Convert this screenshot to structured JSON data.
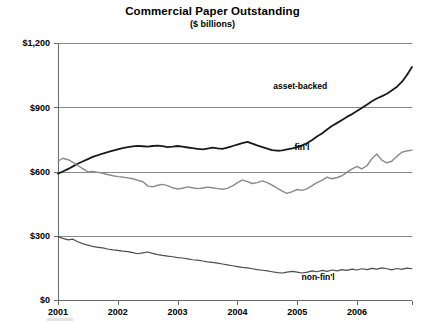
{
  "chart_data": {
    "type": "line",
    "title": "Commercial Paper Outstanding",
    "subtitle": "($ billions)",
    "xlabel": "",
    "ylabel": "",
    "ylim": [
      0,
      1200
    ],
    "xlim": [
      2001.0,
      2006.92
    ],
    "yticks": [
      0,
      300,
      600,
      900,
      1200
    ],
    "ytick_labels": [
      "$0",
      "$300",
      "$600",
      "$900",
      "$1,200"
    ],
    "xticks": [
      2001,
      2002,
      2003,
      2004,
      2005,
      2006
    ],
    "xtick_labels": [
      "2001",
      "2002",
      "2003",
      "2004",
      "2005",
      "2006"
    ],
    "grid": true,
    "grid_axis": "y",
    "legend_position": "inline-annotations",
    "series": [
      {
        "name": "asset-backed",
        "color": "#1a1a1a",
        "linewidth": 1.8,
        "label_x": 2005.05,
        "label_y": 985,
        "x": [
          2001.0,
          2001.08,
          2001.17,
          2001.25,
          2001.33,
          2001.42,
          2001.5,
          2001.58,
          2001.67,
          2001.75,
          2001.83,
          2001.92,
          2002.0,
          2002.08,
          2002.17,
          2002.25,
          2002.33,
          2002.42,
          2002.5,
          2002.58,
          2002.67,
          2002.75,
          2002.83,
          2002.92,
          2003.0,
          2003.08,
          2003.17,
          2003.25,
          2003.33,
          2003.42,
          2003.5,
          2003.58,
          2003.67,
          2003.75,
          2003.83,
          2003.92,
          2004.0,
          2004.08,
          2004.17,
          2004.25,
          2004.33,
          2004.42,
          2004.5,
          2004.58,
          2004.67,
          2004.75,
          2004.83,
          2004.92,
          2005.0,
          2005.08,
          2005.17,
          2005.25,
          2005.33,
          2005.42,
          2005.5,
          2005.58,
          2005.67,
          2005.75,
          2005.83,
          2005.92,
          2006.0,
          2006.08,
          2006.17,
          2006.25,
          2006.33,
          2006.42,
          2006.5,
          2006.58,
          2006.67,
          2006.75,
          2006.83,
          2006.92
        ],
        "values": [
          590,
          600,
          612,
          624,
          636,
          648,
          658,
          668,
          676,
          684,
          690,
          697,
          703,
          709,
          714,
          717,
          720,
          718,
          716,
          719,
          721,
          718,
          714,
          716,
          719,
          716,
          712,
          709,
          706,
          703,
          707,
          711,
          708,
          706,
          712,
          719,
          726,
          733,
          738,
          730,
          722,
          714,
          707,
          700,
          697,
          699,
          703,
          708,
          714,
          722,
          733,
          747,
          763,
          779,
          796,
          812,
          827,
          841,
          855,
          868,
          882,
          897,
          913,
          928,
          941,
          952,
          963,
          978,
          996,
          1018,
          1048,
          1088
        ]
      },
      {
        "name": "fin'l",
        "color": "#8a8a8a",
        "linewidth": 1.4,
        "label_x": 2005.08,
        "label_y": 700,
        "x": [
          2001.0,
          2001.08,
          2001.17,
          2001.25,
          2001.33,
          2001.42,
          2001.5,
          2001.58,
          2001.67,
          2001.75,
          2001.83,
          2001.92,
          2002.0,
          2002.08,
          2002.17,
          2002.25,
          2002.33,
          2002.42,
          2002.5,
          2002.58,
          2002.67,
          2002.75,
          2002.83,
          2002.92,
          2003.0,
          2003.08,
          2003.17,
          2003.25,
          2003.33,
          2003.42,
          2003.5,
          2003.58,
          2003.67,
          2003.75,
          2003.83,
          2003.92,
          2004.0,
          2004.08,
          2004.17,
          2004.25,
          2004.33,
          2004.42,
          2004.5,
          2004.58,
          2004.67,
          2004.75,
          2004.83,
          2004.92,
          2005.0,
          2005.08,
          2005.17,
          2005.25,
          2005.33,
          2005.42,
          2005.5,
          2005.58,
          2005.67,
          2005.75,
          2005.83,
          2005.92,
          2006.0,
          2006.08,
          2006.17,
          2006.25,
          2006.33,
          2006.42,
          2006.5,
          2006.58,
          2006.67,
          2006.75,
          2006.83,
          2006.92
        ],
        "values": [
          648,
          662,
          655,
          643,
          628,
          612,
          598,
          600,
          596,
          592,
          586,
          580,
          576,
          574,
          570,
          566,
          560,
          552,
          533,
          528,
          536,
          540,
          534,
          524,
          518,
          522,
          528,
          524,
          520,
          523,
          527,
          524,
          520,
          517,
          521,
          533,
          548,
          560,
          553,
          544,
          548,
          556,
          548,
          536,
          521,
          508,
          498,
          506,
          516,
          512,
          520,
          534,
          548,
          560,
          574,
          566,
          572,
          580,
          596,
          612,
          624,
          612,
          628,
          660,
          682,
          652,
          640,
          648,
          672,
          690,
          696,
          700
        ]
      },
      {
        "name": "non-fin'l",
        "color": "#4d4d4d",
        "linewidth": 1.2,
        "label_x": 2005.35,
        "label_y": 92,
        "x": [
          2001.0,
          2001.08,
          2001.17,
          2001.25,
          2001.33,
          2001.42,
          2001.5,
          2001.58,
          2001.67,
          2001.75,
          2001.83,
          2001.92,
          2002.0,
          2002.08,
          2002.17,
          2002.25,
          2002.33,
          2002.42,
          2002.5,
          2002.58,
          2002.67,
          2002.75,
          2002.83,
          2002.92,
          2003.0,
          2003.08,
          2003.17,
          2003.25,
          2003.33,
          2003.42,
          2003.5,
          2003.58,
          2003.67,
          2003.75,
          2003.83,
          2003.92,
          2004.0,
          2004.08,
          2004.17,
          2004.25,
          2004.33,
          2004.42,
          2004.5,
          2004.58,
          2004.67,
          2004.75,
          2004.83,
          2004.92,
          2005.0,
          2005.08,
          2005.17,
          2005.25,
          2005.33,
          2005.42,
          2005.5,
          2005.58,
          2005.67,
          2005.75,
          2005.83,
          2005.92,
          2006.0,
          2006.08,
          2006.17,
          2006.25,
          2006.33,
          2006.42,
          2006.5,
          2006.58,
          2006.67,
          2006.75,
          2006.83,
          2006.92
        ],
        "values": [
          296,
          288,
          281,
          284,
          272,
          262,
          256,
          250,
          246,
          243,
          238,
          234,
          232,
          228,
          226,
          221,
          216,
          220,
          224,
          218,
          212,
          208,
          205,
          202,
          198,
          196,
          192,
          188,
          186,
          182,
          178,
          176,
          172,
          168,
          164,
          160,
          156,
          152,
          150,
          146,
          142,
          139,
          136,
          132,
          128,
          126,
          130,
          134,
          130,
          126,
          130,
          136,
          132,
          138,
          134,
          140,
          136,
          142,
          138,
          144,
          140,
          146,
          142,
          148,
          144,
          150,
          146,
          141,
          147,
          143,
          149,
          146
        ]
      }
    ]
  }
}
